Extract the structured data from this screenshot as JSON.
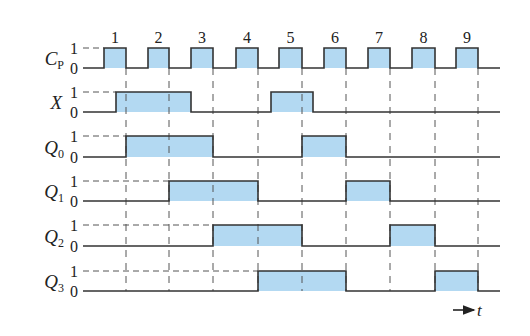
{
  "figure": {
    "type": "timing-diagram",
    "colors": {
      "fill": "#b3d9f2",
      "line": "#333333",
      "dash": "#555555"
    },
    "geometry": {
      "x_start": 83,
      "x_end": 500,
      "row_high_y": [
        48,
        92,
        136,
        181,
        225,
        271
      ],
      "row_low_y": [
        68,
        112,
        157,
        201,
        246,
        291
      ],
      "label_x": 62,
      "level_x": 74,
      "dashed_v_top": 68,
      "dashed_v_bottom": 291,
      "pulse_label_y": 43
    },
    "level_labels": {
      "high": "1",
      "low": "0"
    },
    "clock_pulses": [
      {
        "label": "1",
        "rise": 104,
        "fall": 126
      },
      {
        "label": "2",
        "rise": 148,
        "fall": 169
      },
      {
        "label": "3",
        "rise": 191,
        "fall": 213
      },
      {
        "label": "4",
        "rise": 236,
        "fall": 258
      },
      {
        "label": "5",
        "rise": 279,
        "fall": 302
      },
      {
        "label": "6",
        "rise": 324,
        "fall": 346
      },
      {
        "label": "7",
        "rise": 368,
        "fall": 390
      },
      {
        "label": "8",
        "rise": 412,
        "fall": 435
      },
      {
        "label": "9",
        "rise": 456,
        "fall": 478
      }
    ],
    "signals": [
      {
        "name": "C",
        "subscript": "P",
        "high_intervals": "clock"
      },
      {
        "name": "X",
        "subscript": "",
        "high_intervals": [
          [
            116,
            191
          ],
          [
            271,
            313
          ]
        ]
      },
      {
        "name": "Q",
        "subscript": "0",
        "high_intervals": [
          [
            126,
            213
          ],
          [
            302,
            346
          ]
        ]
      },
      {
        "name": "Q",
        "subscript": "1",
        "high_intervals": [
          [
            169,
            258
          ],
          [
            346,
            390
          ]
        ]
      },
      {
        "name": "Q",
        "subscript": "2",
        "high_intervals": [
          [
            213,
            302
          ],
          [
            390,
            435
          ]
        ]
      },
      {
        "name": "Q",
        "subscript": "3",
        "high_intervals": [
          [
            258,
            346
          ],
          [
            435,
            478
          ]
        ]
      }
    ],
    "time_axis": {
      "label": "t",
      "arrow_x1": 453,
      "arrow_x2": 474,
      "y": 310
    }
  }
}
